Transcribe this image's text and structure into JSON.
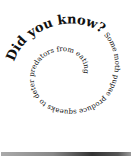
{
  "spiral": {
    "title": "Did you know?",
    "body": " Some moth pupae produce squeaks to deter predators from eating them."
  },
  "bottom_bar": {
    "label": ""
  }
}
